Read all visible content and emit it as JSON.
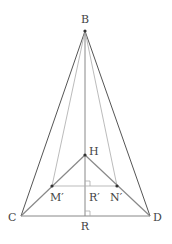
{
  "diagram": {
    "points": {
      "B": {
        "x": 85,
        "y": 31,
        "label": "B",
        "lx": 85,
        "ly": 23,
        "anchor": "middle"
      },
      "H": {
        "x": 85,
        "y": 155,
        "label": "H",
        "lx": 89,
        "ly": 155,
        "anchor": "start"
      },
      "M": {
        "x": 52,
        "y": 186,
        "label": "M′",
        "lx": 50,
        "ly": 201,
        "anchor": "start"
      },
      "N": {
        "x": 117,
        "y": 186,
        "label": "N′",
        "lx": 110,
        "ly": 201,
        "anchor": "start"
      },
      "Rp": {
        "x": 85,
        "y": 186,
        "label": "R′",
        "lx": 89,
        "ly": 201,
        "anchor": "start"
      },
      "C": {
        "x": 21,
        "y": 216,
        "label": "C",
        "lx": 8,
        "ly": 221,
        "anchor": "start"
      },
      "D": {
        "x": 150,
        "y": 216,
        "label": "D",
        "lx": 153,
        "ly": 221,
        "anchor": "start"
      },
      "R": {
        "x": 85,
        "y": 216,
        "label": "R",
        "lx": 85,
        "ly": 230,
        "anchor": "middle"
      }
    },
    "colors": {
      "dark": "#555555",
      "medium": "#888888",
      "light": "#aaaaaa"
    }
  }
}
